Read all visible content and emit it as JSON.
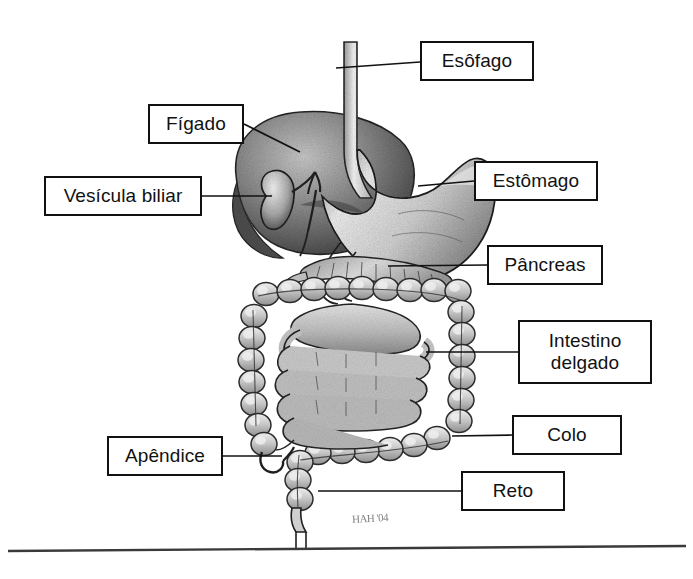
{
  "document": {
    "title": "Sistema digestório",
    "language": "pt-BR",
    "style": "grayscale stippled anatomical illustration with boxed leader labels"
  },
  "colors": {
    "ink": "#111111",
    "paper": "#ffffff",
    "organ_light": "#e8e8e8",
    "organ_mid": "#9a9a9a",
    "organ_dark": "#4a4a4a",
    "rule": "#3a3a3a"
  },
  "labels": [
    {
      "id": "esofago",
      "text": "Esôfago",
      "x": 420,
      "y": 41,
      "w": 114,
      "h": 40
    },
    {
      "id": "figado",
      "text": "Fígado",
      "x": 148,
      "y": 104,
      "w": 96,
      "h": 40
    },
    {
      "id": "vesicula",
      "text": "Vesícula biliar",
      "x": 44,
      "y": 176,
      "w": 158,
      "h": 40
    },
    {
      "id": "estomago",
      "text": "Estômago",
      "x": 474,
      "y": 161,
      "w": 124,
      "h": 40
    },
    {
      "id": "pancreas",
      "text": "Pâncreas",
      "x": 487,
      "y": 245,
      "w": 116,
      "h": 40
    },
    {
      "id": "intestino",
      "text": "Intestino\ndelgado",
      "x": 518,
      "y": 320,
      "w": 134,
      "h": 64
    },
    {
      "id": "colo",
      "text": "Colo",
      "x": 512,
      "y": 415,
      "w": 110,
      "h": 40
    },
    {
      "id": "apendice",
      "text": "Apêndice",
      "x": 107,
      "y": 436,
      "w": 116,
      "h": 40
    },
    {
      "id": "reto",
      "text": "Reto",
      "x": 461,
      "y": 471,
      "w": 104,
      "h": 40
    }
  ],
  "signature": {
    "text": "HAH '04"
  },
  "footer_rule": {
    "present": true,
    "y_left": 551,
    "y_right": 546
  }
}
